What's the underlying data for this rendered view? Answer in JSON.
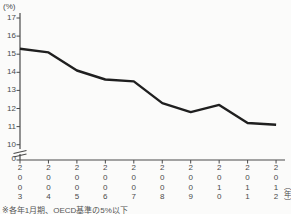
{
  "labels": {
    "y_unit": "(%)",
    "x_unit": "（年）",
    "caption": "※各年1月期、OECD基準の5%以下"
  },
  "chart_data": {
    "type": "line",
    "title": "",
    "categories": [
      "2003",
      "2004",
      "2005",
      "2006",
      "2007",
      "2008",
      "2009",
      "2010",
      "2011",
      "2012"
    ],
    "values": [
      15.3,
      15.1,
      14.1,
      13.6,
      13.5,
      12.3,
      11.8,
      12.2,
      11.2,
      11.1
    ],
    "yticks": [
      17,
      16,
      15,
      14,
      13,
      12,
      11,
      10,
      0
    ],
    "ylabel": "(%)",
    "xlabel": "（年）",
    "ylim_shown": [
      10,
      17
    ],
    "broken_y_axis": true,
    "grid": false,
    "legend": null,
    "line_color": "#1f1f1f",
    "axis_color": "#4a4a4a",
    "background": "#fbfbfa"
  }
}
